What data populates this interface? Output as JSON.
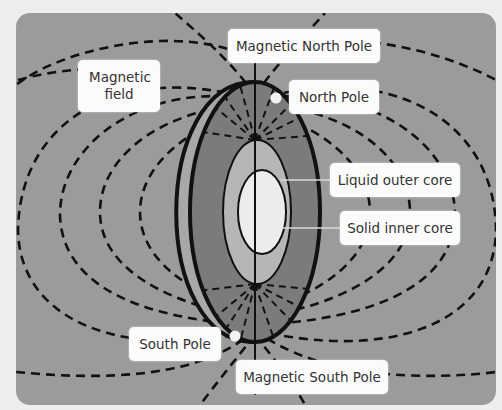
{
  "diagram": {
    "colors": {
      "page_background": "#eeeeee",
      "panel_background": "#9b9b9b",
      "outer_core_ring": "#7a7a7a",
      "liquid_outer_core": "#b4b4b4",
      "solid_inner_core": "#ececec",
      "crust_edge": "#8a8a8a",
      "label_background": "#fbfbfb",
      "field_lines": "#111111"
    },
    "labels": {
      "magnetic_field": "Magnetic field",
      "magnetic_north_pole": "Magnetic North Pole",
      "north_pole": "North Pole",
      "liquid_outer_core": "Liquid outer core",
      "solid_inner_core": "Solid inner core",
      "south_pole": "South Pole",
      "magnetic_south_pole": "Magnetic South Pole"
    },
    "nodes": [
      {
        "id": "magnetic-field",
        "label": "Magnetic field"
      },
      {
        "id": "magnetic-north-pole",
        "label": "Magnetic North Pole"
      },
      {
        "id": "north-pole",
        "label": "North Pole"
      },
      {
        "id": "liquid-outer-core",
        "label": "Liquid outer core"
      },
      {
        "id": "solid-inner-core",
        "label": "Solid inner core"
      },
      {
        "id": "south-pole",
        "label": "South Pole"
      },
      {
        "id": "magnetic-south-pole",
        "label": "Magnetic South Pole"
      }
    ],
    "edges": [
      {
        "from": "liquid-outer-core",
        "to": "outer-core-region",
        "type": "leader-line"
      },
      {
        "from": "solid-inner-core",
        "to": "inner-core-region",
        "type": "leader-line"
      },
      {
        "from": "north-pole",
        "to": "north-pole-dot",
        "type": "marker"
      },
      {
        "from": "south-pole",
        "to": "south-pole-dot",
        "type": "marker"
      }
    ]
  }
}
